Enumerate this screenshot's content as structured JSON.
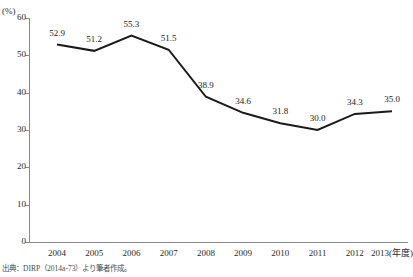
{
  "chart_data": {
    "type": "line",
    "title": "",
    "xlabel": "年度",
    "ylabel": "",
    "y_unit_label": "(%)",
    "categories": [
      "2004",
      "2005",
      "2006",
      "2007",
      "2008",
      "2009",
      "2010",
      "2011",
      "2012",
      "2013"
    ],
    "x_tick_labels": [
      "2004",
      "2005",
      "2006",
      "2007",
      "2008",
      "2009",
      "2010",
      "2011",
      "2012",
      "2013(年度)"
    ],
    "values": [
      52.9,
      51.2,
      55.3,
      51.5,
      38.9,
      34.6,
      31.8,
      30.0,
      34.3,
      35.0
    ],
    "point_labels": [
      "52.9",
      "51.2",
      "55.3",
      "51.5",
      "38.9",
      "34.6",
      "31.8",
      "30.0",
      "34.3",
      "35.0"
    ],
    "ylim": [
      0,
      60
    ],
    "y_ticks": [
      0,
      10,
      20,
      30,
      40,
      50,
      60
    ],
    "y_tick_labels": [
      "0",
      "10",
      "20",
      "30",
      "40",
      "50",
      "60"
    ],
    "grid": false,
    "legend": null,
    "series_color": "#1a1a1a",
    "axis_color": "#8a8a8a"
  },
  "source_note": "出典：DIRP（2014a-73）より筆者作成。"
}
